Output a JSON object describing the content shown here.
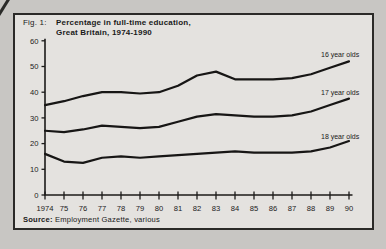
{
  "page": {
    "bg": "#c8c6c3",
    "figure_bg": "#e4e2df",
    "ink": "#1a1a1a"
  },
  "figure": {
    "fig_label": "Fig. 1:",
    "title_line1": "Percentage in full-time education,",
    "title_line2": "Great Britain, 1974-1990",
    "source_label": "Source:",
    "source_text": "Employment Gazette, various"
  },
  "chart_data": {
    "type": "line",
    "title": "Percentage in full-time education, Great Britain, 1974-1990",
    "xlabel": "",
    "ylabel": "",
    "grid": false,
    "legend_position": "inline-right-of-lines",
    "xlim": [
      1974,
      1990
    ],
    "ylim": [
      0,
      60
    ],
    "y_ticks": [
      0,
      10,
      20,
      30,
      40,
      50,
      60
    ],
    "x": [
      1974,
      1975,
      1976,
      1977,
      1978,
      1979,
      1980,
      1981,
      1982,
      1983,
      1984,
      1985,
      1986,
      1987,
      1988,
      1989,
      1990
    ],
    "x_tick_labels": [
      "1974",
      "75",
      "76",
      "77",
      "78",
      "79",
      "80",
      "81",
      "82",
      "83",
      "84",
      "85",
      "86",
      "87",
      "88",
      "89",
      "90"
    ],
    "series": [
      {
        "name": "16 year olds",
        "values": [
          35,
          36.5,
          38.5,
          40,
          40,
          39.5,
          40,
          42.5,
          46.5,
          48,
          45,
          45,
          45,
          45.5,
          47,
          49.5,
          52
        ],
        "label_pos": [
          321,
          57
        ]
      },
      {
        "name": "17 year olds",
        "values": [
          25,
          24.5,
          25.5,
          27,
          26.5,
          26,
          26.5,
          28.5,
          30.5,
          31.5,
          31,
          30.5,
          30.5,
          31,
          32.5,
          35,
          37.5
        ],
        "label_pos": [
          321,
          95
        ]
      },
      {
        "name": "18 year olds",
        "values": [
          16,
          13,
          12.5,
          14.5,
          15,
          14.5,
          15,
          15.5,
          16,
          16.5,
          17,
          16.5,
          16.5,
          16.5,
          17,
          18.5,
          21
        ],
        "label_pos": [
          321,
          139
        ]
      }
    ]
  }
}
